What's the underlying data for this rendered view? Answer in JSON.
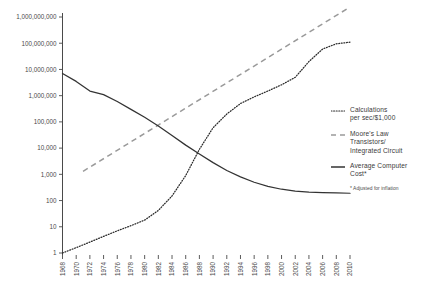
{
  "chart_data": {
    "type": "line",
    "title": "",
    "subtitle": "",
    "xlabel": "",
    "ylabel": "",
    "yscale": "log",
    "ylim": [
      1,
      1000000000
    ],
    "xlim": [
      1968,
      2010
    ],
    "grid": false,
    "legend_position": "right",
    "ytick_labels": [
      "1,000,000,000",
      "100,000,000",
      "10,000,000",
      "1,000,000",
      "100,000",
      "10,000",
      "1,000",
      "100",
      "10",
      "1"
    ],
    "ytick_values": [
      1000000000,
      100000000,
      10000000,
      1000000,
      100000,
      10000,
      1000,
      100,
      10,
      1
    ],
    "xtick_labels": [
      "1968",
      "1970",
      "1972",
      "1974",
      "1976",
      "1978",
      "1980",
      "1982",
      "1984",
      "1986",
      "1988",
      "1990",
      "1992",
      "1994",
      "1996",
      "1998",
      "2000",
      "2002",
      "2004",
      "2006",
      "2008",
      "2010"
    ],
    "xtick_values": [
      1968,
      1970,
      1972,
      1974,
      1976,
      1978,
      1980,
      1982,
      1984,
      1986,
      1988,
      1990,
      1992,
      1994,
      1996,
      1998,
      2000,
      2002,
      2004,
      2006,
      2008,
      2010
    ],
    "series": [
      {
        "name": "Calculations per sec/$1,000",
        "style": "dotted",
        "color": "#2b2b2b",
        "x": [
          1968,
          1970,
          1972,
          1974,
          1976,
          1978,
          1980,
          1982,
          1984,
          1986,
          1988,
          1990,
          1992,
          1994,
          1996,
          1998,
          2000,
          2002,
          2004,
          2006,
          2008,
          2010
        ],
        "values": [
          1,
          1.6,
          2.6,
          4.3,
          7,
          11,
          18,
          42,
          150,
          900,
          9000,
          60000,
          200000,
          500000,
          900000,
          1500000,
          2600000,
          5000000,
          20000000,
          60000000,
          95000000,
          110000000
        ]
      },
      {
        "name": "Moore's Law Transistors/Integrated Circuit",
        "style": "dashed",
        "color": "#9a9a9a",
        "x": [
          1971,
          2010
        ],
        "values": [
          1300,
          2400000000
        ]
      },
      {
        "name": "Average Computer Cost*",
        "style": "solid",
        "color": "#333333",
        "x": [
          1968,
          1970,
          1972,
          1974,
          1976,
          1978,
          1980,
          1982,
          1984,
          1986,
          1988,
          1990,
          1992,
          1994,
          1996,
          1998,
          2000,
          2002,
          2004,
          2006,
          2008,
          2010
        ],
        "values": [
          7000000,
          3500000,
          1500000,
          1100000,
          600000,
          300000,
          150000,
          70000,
          30000,
          13000,
          6000,
          2800,
          1400,
          800,
          500,
          350,
          270,
          230,
          210,
          200,
          195,
          190
        ]
      }
    ]
  },
  "legend": {
    "items": [
      {
        "swatch": "dotted-line-swatch",
        "lines": [
          "Calculations",
          "per sec/$1,000"
        ]
      },
      {
        "swatch": "dashed-line-swatch",
        "lines": [
          "Moore's Law",
          "Transistors/",
          "Integrated Circuit"
        ]
      },
      {
        "swatch": "solid-line-swatch",
        "lines": [
          "Average Computer",
          "Cost*"
        ]
      }
    ],
    "footnote": "* Adjusted for inflation"
  }
}
